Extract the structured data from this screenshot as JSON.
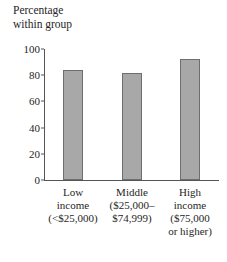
{
  "chart_data": {
    "type": "bar",
    "title": "Percentage\nwithin group",
    "xlabel": "",
    "ylabel": "",
    "categories": [
      "Low\nincome\n(<$25,000)",
      "Middle\n($25,000–\n$74,999)",
      "High\nincome\n($75,000\nor higher)"
    ],
    "category_names": [
      "Low income",
      "Middle income",
      "High income"
    ],
    "values": [
      84,
      82,
      92
    ],
    "ylim": [
      0,
      100
    ],
    "yticks": [
      0,
      20,
      40,
      60,
      80,
      100
    ],
    "ytick_labels": [
      "0",
      "20",
      "40",
      "60",
      "80",
      "100"
    ],
    "grid": false,
    "legend": null,
    "bar_color": "#a8a8a8",
    "bar_edge_color": "#6e6e6e",
    "axis_color": "#555555"
  }
}
